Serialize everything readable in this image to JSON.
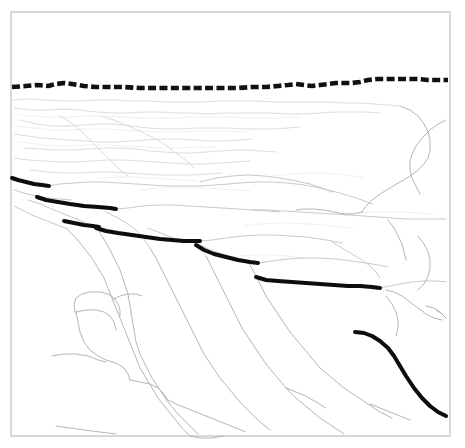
{
  "figure": {
    "kind": "line-drawing",
    "width": 465,
    "height": 448,
    "background_color": "#ffffff",
    "caption": ""
  },
  "frame": {
    "name": "figure-border",
    "x": 11,
    "y": 12,
    "width": 439,
    "height": 424,
    "stroke_color": "#b9b9b9",
    "fill_color": "#ffffff"
  },
  "legend_semantics": {
    "skyline": "dashed bold line marking the canyon rim / skyline horizon",
    "marker_bed": "bold solid line segments marking a traced stratigraphic marker bed, offset in steps",
    "faint_lines": "light gray outcrop, bench, gully and ridge outlines of the canyon wall"
  },
  "colors": {
    "ink_bold": "#0d0d0d",
    "ink_dashed": "#111111",
    "faint": "#d8d8d8",
    "faintest": "#ececec",
    "mid": "#c9c9c9",
    "strong": "#b5b5b5",
    "frame": "#b9b9b9",
    "paper": "#ffffff"
  },
  "skyline": {
    "name": "skyline-dashed-line",
    "stroke_width": 4.6,
    "dash_pattern": "8 3.4",
    "points": "12,87 26,86 38,85 48,86 56,84 64,83 72,84 84,86 96,87 110,87 124,87 140,88 156,88 172,88 190,88 206,88 222,88 238,88 252,87 266,87 278,86 288,85 296,84 304,85 312,86 320,85 328,84 336,83 344,83 352,83 360,82 368,80 378,79 388,79 398,79 408,79 418,79 428,80 438,80 448,80"
  },
  "marker_bed_segments": [
    {
      "name": "marker-bed-segment-1",
      "points": "12,178 18,180 26,182 34,184 42,185 49,186"
    },
    {
      "name": "marker-bed-segment-2",
      "points": "37,197 46,200 58,202 70,204 84,206 98,207 110,208 116,209"
    },
    {
      "name": "marker-bed-segment-3",
      "points": "64,221 74,223 84,225 93,226 99,227"
    },
    {
      "name": "marker-bed-segment-4",
      "points": "96,228 106,231 118,233 132,235 146,237 160,239 172,240 184,241 194,241 200,241"
    },
    {
      "name": "marker-bed-segment-5",
      "points": "196,245 204,250 214,254 226,257 238,260 250,262 258,263"
    },
    {
      "name": "marker-bed-segment-6",
      "points": "256,277 266,280 278,281 292,282 306,283 320,284 334,285 348,286 360,286 372,287 380,288"
    },
    {
      "name": "marker-bed-segment-7",
      "points": "355,332 364,333 372,336 380,341 388,348 394,356 400,366 406,376 414,388 422,398 430,406 438,412 446,416"
    }
  ],
  "faint_paths": {
    "upper_bench": [
      "12,100 30,99 46,100 64,101 80,101 96,100 114,100 130,101 148,101 166,102 184,102 202,102 220,101 238,101 256,101 274,102 292,102 310,102 328,102 344,103 360,103 374,104 388,105 400,106",
      "14,108 30,110 48,110 64,109 80,110 96,112 112,113 128,113 144,112 160,112 176,113 192,113 208,114 224,113 240,113 256,113 272,113 288,114 304,114 320,113 336,112 352,112 366,112 380,113",
      "20,120 36,124 52,126 68,126 84,125 100,124 116,124 132,126 148,128 164,129 180,129 196,128 212,128 228,128 244,129 260,129 274,129 288,128 300,127",
      "14,134 28,136 42,138 56,139 70,140 86,141 100,142 116,142 132,141 146,140 162,139 178,139 194,140 210,141 226,141 240,140 252,139",
      "24,148 40,149 56,150 72,150 88,149 104,148 120,148 136,149 150,151 164,152 178,153 192,153 206,152 220,151 234,150 248,150 262,151 276,152",
      "14,158 28,160 44,161 60,162 76,162 92,161 108,160 124,160 140,161 156,162 172,163 188,164 204,164 220,163 236,162 250,161",
      "30,170 48,172 64,173 80,173 96,172 112,172 128,173 144,174 160,175 176,175 192,175 208,174 222,173",
      "100,116 114,120 128,126 142,132 154,138 164,144 172,150 180,156 188,162 194,168",
      "60,116 70,122 80,130 88,138 96,146 104,154 112,162 120,170 128,176"
    ],
    "mid_benches": [
      "48,186 60,184 74,183 88,182 104,182 120,183 136,184 152,185 168,186 184,186 200,186 214,185 228,184 240,183",
      "14,190 24,193 36,196 48,198 60,199 72,200",
      "116,209 128,208 142,206 158,205 174,205 190,206 206,207 222,208 238,209 254,210 268,211 280,212",
      "28,200 40,204 52,209 64,214 74,218 84,222 92,226",
      "14,206 22,210 32,215 42,219 52,223 60,226 68,229",
      "200,182 216,178 232,176 248,175 264,176 280,178 296,181 310,184 322,188 332,192",
      "240,183 256,182 272,182 288,183 304,185 320,188 336,192 350,196 362,200 372,204",
      "252,210 268,210 284,211 300,212 316,213 332,214 348,215 364,216 378,217 392,218 406,219 420,219 434,219 446,219",
      "200,241 212,240 226,238 242,236 258,235 274,235 290,236 306,237 320,239 332,241 342,243",
      "258,263 272,261 288,259 304,258 320,258 336,259 352,261 366,263 378,265 388,267",
      "380,288 390,286 400,284 412,282 424,281 436,281 446,282",
      "106,212 118,218 128,224 136,230 142,236 146,242 150,248",
      "148,228 158,232 168,236 180,240 192,243",
      "198,244 206,248 216,252 228,256 240,259 252,262",
      "332,242 342,248 352,254 362,260 370,266 376,272 380,278"
    ],
    "right_ridge": [
      "400,106 410,110 418,116 424,124 428,132 430,140 430,150 428,158 424,164 418,170 410,176 400,182 390,188 380,194 372,200 366,206 362,212",
      "446,120 438,124 430,130 422,138 416,146 412,154 410,162 410,170 412,178 416,186 420,194",
      "362,212 354,214 344,214 334,212 324,210 314,209 304,209 296,210",
      "388,220 394,228 398,236 402,244 404,252 406,260",
      "418,236 424,244 428,252 430,260 430,268 428,276 424,284 418,290",
      "386,290 394,292 402,296 410,302 418,308 426,314 434,318 442,320",
      "386,296 392,304 396,312 398,320 398,328 396,336",
      "426,306 434,308 440,312 444,316",
      "436,310 442,314 446,318"
    ],
    "lower_canyon": [
      "68,230 76,238 84,248 92,258 98,268 104,278 108,288 112,298 116,308 120,318 124,328 128,338 132,348 136,358 140,368 146,378 152,388 158,398 166,408 174,418 182,428 190,436",
      "96,226 102,236 108,246 114,258 120,270 124,282 128,294 130,306 132,318 134,330 136,342 140,354 146,366 152,378 160,390 168,402 178,414 188,424 198,434",
      "150,248 156,258 162,270 168,282 174,294 180,306 186,318 192,330 198,342 204,354 212,366 220,378 230,390 240,402 250,412 260,422 270,430",
      "206,256 212,268 218,280 224,292 230,304 236,316 242,328 250,340 258,352 266,364 276,376 286,388 296,398 308,408 320,418 332,426 344,434",
      "248,262 254,272 260,284 266,296 274,308 282,320 290,332 300,344 310,356 320,368 332,378 344,388 356,396 368,404 380,412 392,418",
      "112,300 120,296 128,294 136,294 142,296",
      "75,312 86,310 96,310 104,312 110,316 114,322 116,330",
      "76,312 78,322 80,332 84,342 90,350 98,356 106,360",
      "106,360 112,362 118,364 124,368 128,374 130,380",
      "52,356 64,354 76,354 88,356 98,360 106,362",
      "130,380 140,382 150,384 158,388 164,394 168,400",
      "75,312 74,304 76,298 82,294 90,292 100,292 108,294",
      "108,294 114,298 118,304 120,310 120,316",
      "168,400 176,404 186,408 196,412 206,416",
      "206,416 216,420 226,424 236,428 246,432",
      "286,388 296,392 306,396 316,402 326,408",
      "370,404 380,408 390,412 400,416 410,420",
      "190,436 200,438 212,438 224,436",
      "56,426 70,428 84,430 100,432 116,434"
    ],
    "faintest_texture": [
      "14,114 30,116 48,117 66,117 84,116 102,116 120,117 138,118 156,118 174,118 192,117 210,117 228,117 246,118 264,118 282,118 300,117",
      "16,126 34,128 52,130 70,130 88,129 106,129 124,130 142,131 160,132 178,132 196,131 214,131 232,131 250,132",
      "18,142 36,144 54,146 72,146 90,145 108,145 126,146 144,147 162,148 180,148 198,147 216,147",
      "140,190 156,188 172,187 188,187 204,188 220,189 236,190 250,191",
      "244,226 260,224 276,223 292,223 308,224 324,225 340,227 354,228",
      "274,176 290,174 306,173 322,173 338,174 352,176 364,178",
      "224,258 240,256 256,255 272,255 288,256 304,258",
      "340,214 356,213 372,212 388,212 404,212 420,213 434,214",
      "102,178 118,177 134,177 150,178 166,179 182,180 196,181"
    ]
  }
}
